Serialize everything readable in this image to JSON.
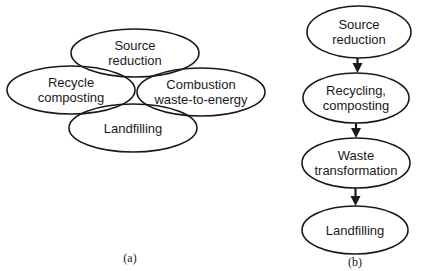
{
  "diagram_a": {
    "caption": "(a)",
    "nodes": [
      {
        "id": "source-reduction",
        "lines": [
          "Source",
          "reduction"
        ],
        "cx": 135,
        "cy": 53,
        "rx": 64,
        "ry": 24
      },
      {
        "id": "recycle-composting",
        "lines": [
          "Recycle",
          "composting"
        ],
        "cx": 71,
        "cy": 90,
        "rx": 64,
        "ry": 24
      },
      {
        "id": "combustion",
        "lines": [
          "Combustion",
          "waste-to-energy"
        ],
        "cx": 201,
        "cy": 92,
        "rx": 64,
        "ry": 24
      },
      {
        "id": "landfilling",
        "lines": [
          "Landfilling"
        ],
        "cx": 133,
        "cy": 128,
        "rx": 64,
        "ry": 24
      }
    ]
  },
  "diagram_b": {
    "caption": "(b)",
    "nodes": [
      {
        "id": "source-reduction",
        "lines": [
          "Source",
          "reduction"
        ],
        "cx": 359,
        "cy": 32,
        "rx": 52,
        "ry": 26
      },
      {
        "id": "recycling-composting",
        "lines": [
          "Recycling,",
          "composting"
        ],
        "cx": 356,
        "cy": 98,
        "rx": 53,
        "ry": 25
      },
      {
        "id": "waste-transformation",
        "lines": [
          "Waste",
          "transformation"
        ],
        "cx": 356,
        "cy": 163,
        "rx": 54,
        "ry": 25
      },
      {
        "id": "landfilling",
        "lines": [
          "Landfilling"
        ],
        "cx": 355,
        "cy": 230,
        "rx": 53,
        "ry": 24
      }
    ],
    "edges": [
      {
        "from": "source-reduction",
        "to": "recycling-composting"
      },
      {
        "from": "recycling-composting",
        "to": "waste-transformation"
      },
      {
        "from": "waste-transformation",
        "to": "landfilling"
      }
    ]
  }
}
